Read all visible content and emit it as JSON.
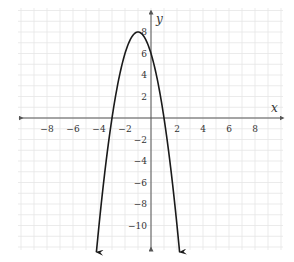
{
  "chart_data": {
    "type": "line",
    "title": "",
    "xlabel": "x",
    "ylabel": "y",
    "xlim": [
      -10,
      10
    ],
    "ylim": [
      -12,
      10
    ],
    "grid": true,
    "x_ticks": [
      -8,
      -6,
      -4,
      -2,
      2,
      4,
      6,
      8
    ],
    "y_ticks": [
      8,
      6,
      4,
      2,
      -2,
      -4,
      -6,
      -8,
      -10
    ],
    "x_tick_labels": [
      "−8",
      "−6",
      "−4",
      "−2",
      "2",
      "4",
      "6",
      "8"
    ],
    "y_tick_labels": [
      "8",
      "6",
      "4",
      "2",
      "−2",
      "−4",
      "−6",
      "−8",
      "−10"
    ],
    "series": [
      {
        "name": "parabola",
        "equation": "y = -2(x + 1)^2 + 8",
        "vertex": [
          -1,
          8
        ],
        "x_intercepts": [
          -3,
          1
        ],
        "y_intercept": 6,
        "x_range": [
          -4.2,
          2.2
        ],
        "arrows": "both ends pointing down",
        "color": "#1a1a1a"
      }
    ]
  },
  "colors": {
    "grid": "#e6e6e6",
    "axis": "#555555",
    "curve": "#1a1a1a"
  }
}
